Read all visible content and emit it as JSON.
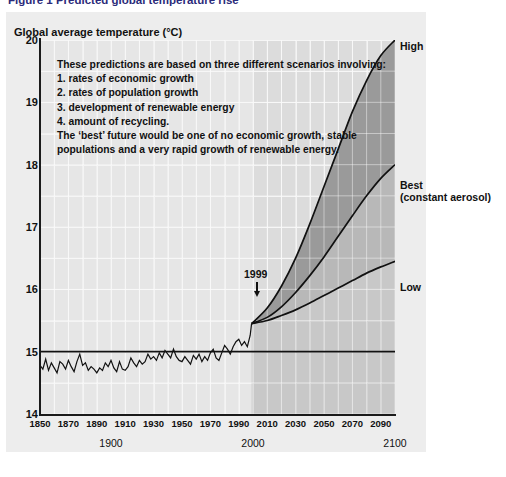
{
  "figure": {
    "title": "Figure 1 Predicted global temperature rise"
  },
  "axis": {
    "y_title": "Global average temperature (°C)",
    "y_ticks": [
      "20",
      "19",
      "18",
      "17",
      "16",
      "15",
      "14"
    ],
    "x_ticks": [
      "1850",
      "1870",
      "1890",
      "1910",
      "1930",
      "1950",
      "1970",
      "1990",
      "2010",
      "2030",
      "2050",
      "2070",
      "2090"
    ],
    "x_major_labels": [
      "1900",
      "2000",
      "2100"
    ]
  },
  "annotation": {
    "line1": "These predictions are based on three different scenarios involving:",
    "line2": "1. rates of economic growth",
    "line3": "2. rates of population growth",
    "line4": "3. development of renewable energy",
    "line5": "4. amount of recycling.",
    "line6": "The ‘best’ future would be one of no economic growth, stable",
    "line7": "populations and a very rapid growth of renewable energy."
  },
  "markers": {
    "year_1999": "1999"
  },
  "scenario_labels": {
    "high": "High",
    "best": "Best",
    "best_sub": "(constant aerosol)",
    "low": "Low"
  },
  "colors": {
    "panel_bg": "#ededed",
    "plot_bg": "#e6e6e6",
    "future_bg": "#dcdcdc",
    "band_high_best": "#9a9a9a",
    "band_best_low": "#b8b8b8",
    "curve": "#111111",
    "gridline": "#f4f4f4",
    "axis": "#1a1a1a",
    "title": "#2b2b7a"
  },
  "chart_data": {
    "type": "line",
    "title": "Figure 1 Predicted global temperature rise",
    "xlabel": "Year",
    "ylabel": "Global average temperature (°C)",
    "xlim": [
      1850,
      2100
    ],
    "ylim": [
      14,
      20
    ],
    "grid": true,
    "legend": "right-of-plot, inline curve end labels",
    "annotations": [
      {
        "text": "1999",
        "x": 1999,
        "y": 15.45,
        "type": "arrow-down"
      },
      {
        "text": "These predictions are based on three different scenarios involving: 1. rates of economic growth 2. rates of population growth 3. development of renewable energy 4. amount of recycling. The ‘best’ future would be one of no economic growth, stable populations and a very rapid growth of renewable energy.",
        "x": 1865,
        "y": 19.4,
        "type": "text-block"
      }
    ],
    "reference_lines": [
      {
        "y": 15.0,
        "orientation": "horizontal",
        "color": "#111111"
      }
    ],
    "shaded_bands": [
      {
        "name": "High-to-Best",
        "upper": "High",
        "lower": "Best",
        "color": "#9a9a9a"
      },
      {
        "name": "Best-to-Low",
        "upper": "Best",
        "lower": "Low",
        "color": "#b8b8b8"
      }
    ],
    "series": [
      {
        "name": "Observed global average temperature",
        "type": "line",
        "x": [
          1850,
          1852,
          1854,
          1856,
          1858,
          1860,
          1862,
          1864,
          1866,
          1868,
          1870,
          1872,
          1874,
          1876,
          1878,
          1880,
          1882,
          1884,
          1886,
          1888,
          1890,
          1892,
          1894,
          1896,
          1898,
          1900,
          1902,
          1904,
          1906,
          1908,
          1910,
          1912,
          1914,
          1916,
          1918,
          1920,
          1922,
          1924,
          1926,
          1928,
          1930,
          1932,
          1934,
          1936,
          1938,
          1940,
          1942,
          1944,
          1946,
          1948,
          1950,
          1952,
          1954,
          1956,
          1958,
          1960,
          1962,
          1964,
          1966,
          1968,
          1970,
          1972,
          1974,
          1976,
          1978,
          1980,
          1982,
          1984,
          1986,
          1988,
          1990,
          1992,
          1994,
          1996,
          1998,
          1999
        ],
        "y": [
          14.78,
          14.72,
          14.88,
          14.7,
          14.82,
          14.74,
          14.66,
          14.84,
          14.8,
          14.72,
          14.86,
          14.76,
          14.68,
          14.84,
          14.96,
          14.78,
          14.82,
          14.7,
          14.76,
          14.72,
          14.66,
          14.74,
          14.7,
          14.82,
          14.76,
          14.86,
          14.74,
          14.68,
          14.84,
          14.72,
          14.7,
          14.76,
          14.9,
          14.82,
          14.76,
          14.86,
          14.8,
          14.84,
          14.96,
          14.88,
          14.92,
          14.86,
          14.98,
          14.9,
          15.02,
          14.96,
          14.9,
          15.04,
          14.92,
          14.86,
          14.84,
          14.92,
          14.86,
          14.8,
          14.94,
          14.88,
          14.96,
          14.84,
          14.92,
          14.86,
          14.98,
          15.04,
          14.9,
          14.86,
          14.98,
          15.1,
          15.04,
          14.96,
          15.08,
          15.16,
          15.2,
          15.1,
          15.16,
          15.08,
          15.26,
          15.45
        ]
      },
      {
        "name": "High",
        "type": "projection",
        "x": [
          1999,
          2010,
          2020,
          2030,
          2040,
          2050,
          2060,
          2070,
          2080,
          2090,
          2100
        ],
        "y": [
          15.45,
          15.7,
          16.05,
          16.5,
          17.05,
          17.65,
          18.25,
          18.85,
          19.35,
          19.75,
          20.0
        ]
      },
      {
        "name": "Best (constant aerosol)",
        "type": "projection",
        "x": [
          1999,
          2010,
          2020,
          2030,
          2040,
          2050,
          2060,
          2070,
          2080,
          2090,
          2100
        ],
        "y": [
          15.45,
          15.55,
          15.72,
          15.95,
          16.22,
          16.52,
          16.85,
          17.18,
          17.5,
          17.78,
          18.0
        ]
      },
      {
        "name": "Low",
        "type": "projection",
        "x": [
          1999,
          2010,
          2020,
          2030,
          2040,
          2050,
          2060,
          2070,
          2080,
          2090,
          2100
        ],
        "y": [
          15.45,
          15.5,
          15.58,
          15.67,
          15.78,
          15.9,
          16.02,
          16.14,
          16.26,
          16.36,
          16.45
        ]
      }
    ]
  }
}
